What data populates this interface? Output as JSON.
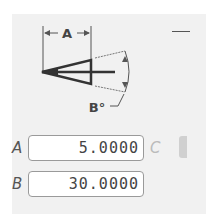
{
  "diagram": {
    "dimension_a_label": "A",
    "dimension_b_label": "B°"
  },
  "fields": [
    {
      "label": "A",
      "value": "5.0000"
    },
    {
      "label": "B",
      "value": "30.0000"
    }
  ],
  "side": {
    "label_c": "C",
    "dash": "—"
  }
}
